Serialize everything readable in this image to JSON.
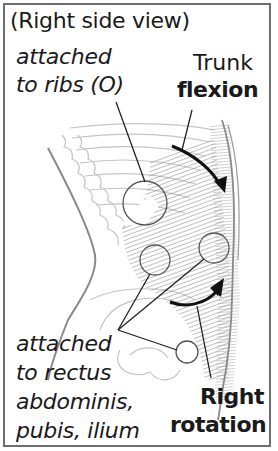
{
  "diagram": {
    "title": "(Right side view)",
    "origin_label": {
      "line1": "attached",
      "line2": "to ribs (O)"
    },
    "action_1": {
      "line1": "Trunk",
      "line2": "flexion"
    },
    "insertion_label": {
      "line1": "attached",
      "line2": "to rectus",
      "line3": "abdominis,",
      "line4": "pubis, ilium"
    },
    "action_2": {
      "line1": "Right",
      "line2": "rotation"
    },
    "colors": {
      "border": "#6e6e6e",
      "text": "#1a1a1a",
      "muscle": "#9a9a9a",
      "outline": "#b5b5b5",
      "arrow": "#111111"
    }
  }
}
